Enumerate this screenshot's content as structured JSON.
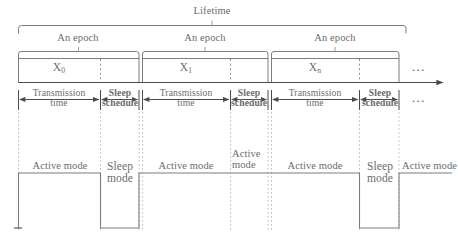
{
  "diagram": {
    "title": "Lifetime",
    "axis_arrow": "timeline-arrow",
    "ellipsis": "...",
    "braces": {
      "lifetime_label": "Lifetime",
      "epoch_label_1": "An epoch",
      "epoch_label_2": "An epoch",
      "epoch_label_3": "An epoch"
    },
    "epochs": [
      {
        "name": "X",
        "sub": "0",
        "label": "X0"
      },
      {
        "name": "X",
        "sub": "1",
        "label": "X1"
      },
      {
        "name": "X",
        "sub": "n",
        "label": "Xn"
      }
    ],
    "intervals": [
      {
        "kind": "transmission",
        "line1": "Transmission",
        "line2": "time"
      },
      {
        "kind": "sleep",
        "line1": "Sleep",
        "line2": "schedule"
      },
      {
        "kind": "transmission",
        "line1": "Transmission",
        "line2": "time"
      },
      {
        "kind": "sleep",
        "line1": "Sleep",
        "line2": "schedule"
      },
      {
        "kind": "transmission",
        "line1": "Transmission",
        "line2": "time"
      },
      {
        "kind": "sleep",
        "line1": "Sleep",
        "line2": "schedule"
      }
    ],
    "interval_ellipsis": "...",
    "modes": [
      {
        "state": "active",
        "line1": "Active mode",
        "line2": ""
      },
      {
        "state": "sleep",
        "line1": "Sleep",
        "line2": "mode"
      },
      {
        "state": "active",
        "line1": "Active mode",
        "line2": ""
      },
      {
        "state": "active",
        "line1": "Active",
        "line2": "mode"
      },
      {
        "state": "active",
        "line1": "Active mode",
        "line2": ""
      },
      {
        "state": "sleep",
        "line1": "Sleep",
        "line2": "mode"
      },
      {
        "state": "active",
        "line1": "Active mode",
        "line2": ""
      }
    ],
    "colors": {
      "line": "#7d7d7d",
      "text": "#6b6b6b",
      "dotted": "#a6a6a6",
      "background": "#ffffff"
    }
  }
}
